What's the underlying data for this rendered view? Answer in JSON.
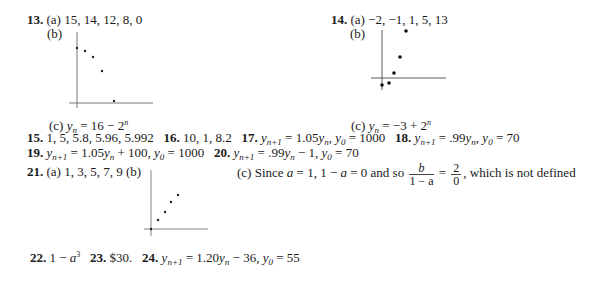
{
  "problems": {
    "p13": {
      "number": "13.",
      "a_label": "(a)",
      "a_values": "15, 14, 12, 8, 0",
      "b_label": "(b)",
      "c_label": "(c)",
      "c_lhs": "y",
      "c_sub": "n",
      "c_eq": " = 16 − 2",
      "c_sup": "n"
    },
    "p14": {
      "number": "14.",
      "a_label": "(a)",
      "a_values": "−2, −1, 1, 5, 13",
      "b_label": "(b)",
      "c_label": "(c)",
      "c_lhs": "y",
      "c_sub": "n",
      "c_eq": " = −3 + 2",
      "c_sup": "n"
    },
    "p15": {
      "number": "15.",
      "text": "1, 5, 5.8, 5.96, 5.992"
    },
    "p16": {
      "number": "16.",
      "text": "10, 1, 8.2"
    },
    "p17": {
      "number": "17.",
      "text1": " = 1.05",
      "text2": ", ",
      "text3": " = 1000"
    },
    "p18": {
      "number": "18.",
      "text1": " = .99",
      "text2": ", ",
      "text3": " = 70"
    },
    "p19": {
      "number": "19.",
      "text1": " = 1.05",
      "text2": " + 100, ",
      "text3": " = 1000"
    },
    "p20": {
      "number": "20.",
      "text1": " = .99",
      "text2": " − 1, ",
      "text3": " = 70"
    },
    "p21": {
      "number": "21.",
      "a_text": "(a) 1, 3, 5, 7, 9 (b)",
      "c_text1": "(c) Since ",
      "c_text2": " = 1, 1 − ",
      "c_text3": " = 0 and so ",
      "frac1_top": "b",
      "frac1_bottom": "1 − a",
      "eq": " = ",
      "frac2_top": "2",
      "frac2_bottom": "0",
      "c_text4": ", which is not defined"
    },
    "p22": {
      "number": "22.",
      "text": "1 − ",
      "var": "a",
      "sup": "3"
    },
    "p23": {
      "number": "23.",
      "text": "$30."
    },
    "p24": {
      "number": "24.",
      "text1": " = 1.20",
      "text2": " − 36, ",
      "text3": " = 55"
    }
  },
  "symbols": {
    "y": "y",
    "n1": "n+1",
    "n": "n",
    "zero": "0",
    "a": "a"
  }
}
